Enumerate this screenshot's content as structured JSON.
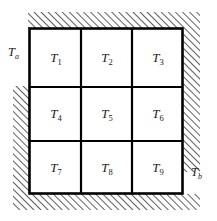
{
  "figure": {
    "name": "three-by-three-nodal-grid-with-hatched-boundaries",
    "background_color": "#ffffff",
    "line_color": "#000000",
    "text_color": "#1a1a1a"
  },
  "grid": {
    "rows": 3,
    "columns": 3,
    "cells": [
      {
        "id": "cell-1",
        "symbol": "T",
        "subscript": "1"
      },
      {
        "id": "cell-2",
        "symbol": "T",
        "subscript": "2"
      },
      {
        "id": "cell-3",
        "symbol": "T",
        "subscript": "3"
      },
      {
        "id": "cell-4",
        "symbol": "T",
        "subscript": "4"
      },
      {
        "id": "cell-5",
        "symbol": "T",
        "subscript": "5"
      },
      {
        "id": "cell-6",
        "symbol": "T",
        "subscript": "6"
      },
      {
        "id": "cell-7",
        "symbol": "T",
        "subscript": "7"
      },
      {
        "id": "cell-8",
        "symbol": "T",
        "subscript": "8"
      },
      {
        "id": "cell-9",
        "symbol": "T",
        "subscript": "9"
      }
    ]
  },
  "boundary_labels": [
    {
      "id": "label-ta",
      "symbol": "T",
      "subscript": "a",
      "position": "outer-upper-left"
    },
    {
      "id": "label-tb",
      "symbol": "T",
      "subscript": "b",
      "position": "outer-lower-right"
    }
  ],
  "hatching": {
    "style": "diagonal-45-degrees",
    "direction": "lower-left-to-upper-right",
    "regions": [
      "top",
      "right",
      "bottom",
      "left"
    ]
  }
}
